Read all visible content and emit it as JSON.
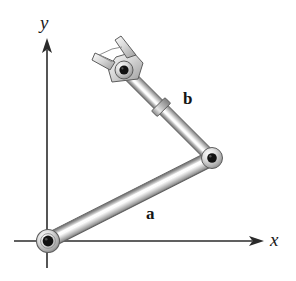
{
  "figure": {
    "background_color": "#ffffff",
    "width": 296,
    "height": 281
  },
  "axes": {
    "x": {
      "label": "x",
      "orientation": "horizontal",
      "arrowhead": "solid-triangle",
      "start_px": [
        14,
        241
      ],
      "end_px": [
        264,
        241
      ],
      "color": "#2b2b2b"
    },
    "y": {
      "label": "y",
      "orientation": "vertical",
      "arrowhead": "solid-triangle",
      "start_px": [
        47,
        268
      ],
      "end_px": [
        47,
        38
      ],
      "color": "#2b2b2b"
    },
    "origin_px": [
      48,
      241
    ]
  },
  "links": [
    {
      "name": "a",
      "label": "a",
      "role": "proximal-link",
      "from_px": [
        48,
        241
      ],
      "to_px": [
        212,
        158
      ],
      "thickness_px": 15,
      "label_position_px": [
        146,
        205
      ],
      "shading": "cylindrical-metal"
    },
    {
      "name": "b",
      "label": "b",
      "role": "distal-link",
      "from_px": [
        212,
        158
      ],
      "to_px": [
        124,
        70
      ],
      "thickness_px": 12,
      "label_position_px": [
        183,
        90
      ],
      "shading": "cylindrical-metal",
      "has_collar": true,
      "collar_position_px": [
        163,
        111
      ]
    }
  ],
  "joints": [
    {
      "name": "base-pivot",
      "position_px": [
        48,
        241
      ],
      "outer_radius_px": 11,
      "pin_radius_px": 5,
      "pin_color": "#111111"
    },
    {
      "name": "elbow-pivot",
      "position_px": [
        212,
        158
      ],
      "outer_radius_px": 10,
      "pin_radius_px": 4.5,
      "pin_color": "#111111"
    },
    {
      "name": "wrist-pivot",
      "position_px": [
        124,
        70
      ],
      "outer_radius_px": 9,
      "pin_radius_px": 4.5,
      "pin_color": "#111111"
    }
  ],
  "end_effector": {
    "name": "fork-clevis",
    "description": "two-pronged fork gripper",
    "pivot_px": [
      124,
      70
    ],
    "prong_count": 2,
    "prong_tip_upper_px": [
      119,
      41
    ],
    "prong_tip_lower_px": [
      96,
      63
    ]
  },
  "colors": {
    "metal_dark": "#6e6e6e",
    "metal_mid": "#a8a8a8",
    "metal_light": "#e8e8e8",
    "metal_highlight": "#fafafa",
    "outline": "#5a5a5a",
    "pin": "#111111",
    "axis": "#2b2b2b",
    "text": "#151515"
  }
}
